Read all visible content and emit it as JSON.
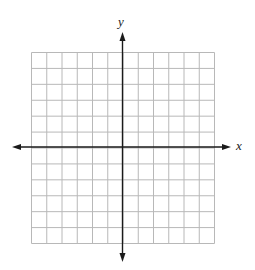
{
  "diagram": {
    "type": "coordinate-grid",
    "x_label": "x",
    "y_label": "y",
    "grid_columns": 12,
    "grid_rows": 12,
    "colors": {
      "grid": "#b5b5b5",
      "axis": "#1a1a1a"
    }
  }
}
